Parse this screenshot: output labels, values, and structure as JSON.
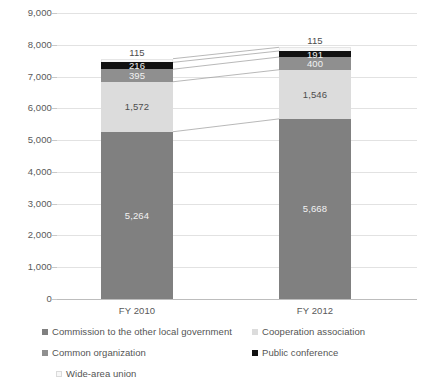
{
  "chart_data": {
    "type": "bar",
    "subtype": "stacked-vertical",
    "title": "",
    "xlabel": "",
    "ylabel": "",
    "ylim": [
      0,
      9000
    ],
    "ystep": 1000,
    "ytick_labels": [
      "0",
      "1,000",
      "2,000",
      "3,000",
      "4,000",
      "5,000",
      "6,000",
      "7,000",
      "8,000",
      "9,000"
    ],
    "grid": true,
    "legend_position": "bottom-left",
    "categories": [
      "FY 2010",
      "FY 2012"
    ],
    "series": [
      {
        "name": "Commission to the other local government",
        "color": "#808080",
        "values": [
          5264,
          5668
        ],
        "value_labels": [
          "5,264",
          "5,668"
        ],
        "label_style": "on-dark"
      },
      {
        "name": "Cooperation association",
        "color": "#dcdcdc",
        "values": [
          1572,
          1546
        ],
        "value_labels": [
          "1,572",
          "1,546"
        ],
        "label_style": "on-light"
      },
      {
        "name": "Common organization",
        "color": "#8f8f8f",
        "values": [
          395,
          400
        ],
        "value_labels": [
          "395",
          "400"
        ],
        "label_style": "on-dark"
      },
      {
        "name": "Public conference",
        "color": "#111111",
        "values": [
          216,
          191
        ],
        "value_labels": [
          "216",
          "191"
        ],
        "label_style": "on-dark"
      },
      {
        "name": "Wide-area union",
        "color": "#f7f7f7",
        "values": [
          115,
          115
        ],
        "value_labels": [
          "115",
          "115"
        ],
        "label_style": "outside"
      }
    ],
    "totals": [
      7562,
      7920
    ],
    "connectors": true
  },
  "legend": {
    "items": [
      {
        "label": "Commission to the other local government",
        "color": "#808080"
      },
      {
        "label": "Cooperation association",
        "color": "#dcdcdc"
      },
      {
        "label": "Common organization",
        "color": "#8f8f8f"
      },
      {
        "label": "Public conference",
        "color": "#111111"
      },
      {
        "label": "Wide-area union",
        "color": "#f7f7f7"
      }
    ]
  }
}
